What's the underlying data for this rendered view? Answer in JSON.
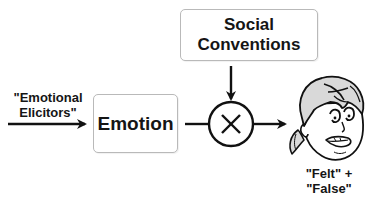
{
  "diagram": {
    "type": "flow",
    "input": {
      "label_line1": "\"Emotional",
      "label_line2": "Elicitors\""
    },
    "nodes": {
      "emotion": {
        "label": "Emotion"
      },
      "social_conventions": {
        "line1": "Social",
        "line2": "Conventions"
      },
      "operator": {
        "symbol": "×",
        "meaning": "multiply / combine"
      }
    },
    "output": {
      "label_line1": "\"Felt\" + \"False\"",
      "label_line2": "Faces",
      "icon": "cartoon-face-icon"
    },
    "edges": [
      {
        "from": "emotional-elicitors",
        "to": "emotion"
      },
      {
        "from": "emotion",
        "to": "operator"
      },
      {
        "from": "social-conventions",
        "to": "operator"
      },
      {
        "from": "operator",
        "to": "faces"
      }
    ],
    "colors": {
      "stroke": "#111111",
      "box_border": "#b9b9b9",
      "background": "#ffffff",
      "hair_fill": "#d9d9d9"
    }
  }
}
